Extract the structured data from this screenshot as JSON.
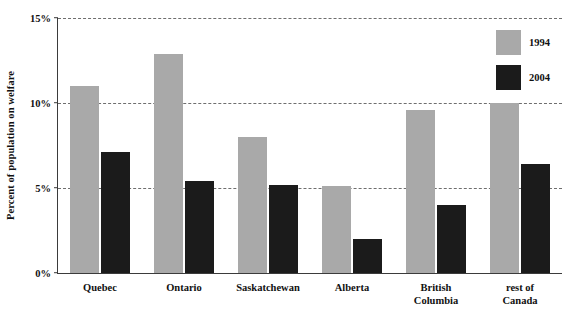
{
  "chart_data": {
    "type": "bar",
    "title": "",
    "xlabel": "",
    "ylabel": "Percent of population on welfare",
    "ylim": [
      0,
      15
    ],
    "ytick_labels": [
      "0%",
      "5%",
      "10%",
      "15%"
    ],
    "ytick_values": [
      0,
      5,
      10,
      15
    ],
    "grid": true,
    "legend_position": "top-right",
    "categories": [
      "Quebec",
      "Ontario",
      "Saskatchewan",
      "Alberta",
      "British\nColumbia",
      "rest of\nCanada"
    ],
    "series": [
      {
        "name": "1994",
        "color": "#a9a9a9",
        "values": [
          11.0,
          12.9,
          8.0,
          5.1,
          9.6,
          10.0
        ]
      },
      {
        "name": "2004",
        "color": "#1b1b1b",
        "values": [
          7.1,
          5.4,
          5.2,
          2.0,
          4.0,
          6.4
        ]
      }
    ]
  },
  "axis": {
    "y_title": "Percent of population on welfare"
  },
  "legend": {
    "entries": [
      {
        "label": "1994",
        "color": "#a9a9a9"
      },
      {
        "label": "2004",
        "color": "#1b1b1b"
      }
    ]
  },
  "colors": {
    "series_1994": "#a9a9a9",
    "series_2004": "#1b1b1b",
    "axis": "#3b3b3b",
    "gridline": "#6e6e6e",
    "text": "#111111",
    "background": "#ffffff"
  }
}
